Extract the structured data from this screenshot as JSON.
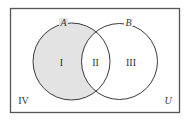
{
  "diagram": {
    "type": "venn-diagram",
    "universe_label": "U",
    "sets": [
      {
        "name": "A",
        "label": "A"
      },
      {
        "name": "B",
        "label": "B"
      }
    ],
    "regions": [
      {
        "id": "I",
        "label": "I",
        "description": "A only",
        "shaded": true
      },
      {
        "id": "II",
        "label": "II",
        "description": "A and B",
        "shaded": false
      },
      {
        "id": "III",
        "label": "III",
        "description": "B only",
        "shaded": false
      },
      {
        "id": "IV",
        "label": "IV",
        "description": "outside A and B",
        "shaded": false
      }
    ],
    "colors": {
      "shade": "#e3e3e3",
      "stroke": "#3a3a3a",
      "frame": "#555555",
      "background": "#ffffff"
    }
  }
}
